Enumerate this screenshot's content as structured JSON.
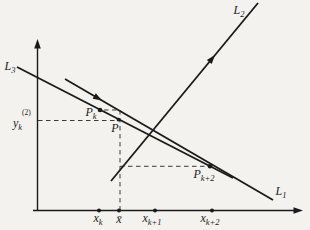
{
  "figure": {
    "background_color": "#f4f2ee",
    "ink_color": "#1a1a1a",
    "dash_color": "#3a3a3a",
    "labels": {
      "l1": {
        "base": "L",
        "sub": "1"
      },
      "l2": {
        "base": "L",
        "sub": "2"
      },
      "l3": {
        "base": "L",
        "sub": "3"
      },
      "p_k": {
        "base": "P",
        "sub": "k"
      },
      "p": {
        "base": "P"
      },
      "p_k2": {
        "base": "P",
        "sub": "k+2"
      },
      "y_k2": {
        "sup": "(2)",
        "base": "y",
        "sub": "k"
      },
      "x_k": {
        "base": "x",
        "sub": "k"
      },
      "x_bar": {
        "base": "x̄"
      },
      "x_k1": {
        "base": "x",
        "sub": "k+1"
      },
      "x_k2": {
        "base": "x",
        "sub": "k+2"
      }
    }
  }
}
